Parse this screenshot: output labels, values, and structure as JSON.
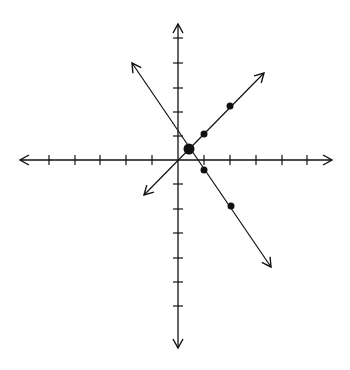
{
  "chart_data": {
    "type": "line",
    "title": "",
    "xlabel": "",
    "ylabel": "",
    "grid": false,
    "xlim": [
      -6,
      6
    ],
    "ylim": [
      -7,
      5
    ],
    "x_ticks": [
      -5,
      -4,
      -3,
      -2,
      -1,
      1,
      2,
      3,
      4,
      5
    ],
    "y_ticks": [
      -6,
      -5,
      -4,
      -3,
      -2,
      -1,
      1,
      2,
      3,
      4,
      5
    ],
    "series": [
      {
        "name": "line-positive-slope",
        "equation": "y = x",
        "points": [
          [
            1,
            1
          ],
          [
            2,
            2
          ]
        ],
        "arrow_ends": [
          [
            -1.3,
            -1.3
          ],
          [
            3.3,
            3.6
          ]
        ]
      },
      {
        "name": "line-negative-slope",
        "equation": "y = -1.4x + 1.4",
        "points": [
          [
            1,
            -0.4
          ],
          [
            2,
            -1.8
          ]
        ],
        "arrow_ends": [
          [
            -1.8,
            3.7
          ],
          [
            3.6,
            -4.2
          ]
        ]
      }
    ],
    "intersection": {
      "x": 0.4,
      "y": 0.45
    }
  },
  "colors": {
    "stroke": "#111111",
    "background": "#ffffff"
  },
  "geometry": {
    "origin": {
      "x": 178,
      "y": 160
    },
    "unit_x": 26,
    "unit_y": 24.5,
    "x_axis": {
      "x1": 20,
      "x2": 332
    },
    "y_axis": {
      "y1": 24,
      "y2": 348
    },
    "x_tick_px": [
      49,
      75,
      100,
      126,
      152,
      204,
      230,
      256,
      282,
      307
    ],
    "y_tick_px": [
      38,
      63,
      88,
      112,
      136,
      184,
      209,
      233,
      258,
      282,
      306
    ],
    "line1": {
      "x1": 144,
      "y1": 195,
      "x2": 264,
      "y2": 73
    },
    "line2": {
      "x1": 132,
      "y1": 63,
      "x2": 271,
      "y2": 267
    },
    "points_small": [
      [
        204,
        134
      ],
      [
        230,
        106
      ],
      [
        204,
        170
      ],
      [
        231,
        206
      ]
    ],
    "point_large": [
      189,
      149
    ]
  }
}
